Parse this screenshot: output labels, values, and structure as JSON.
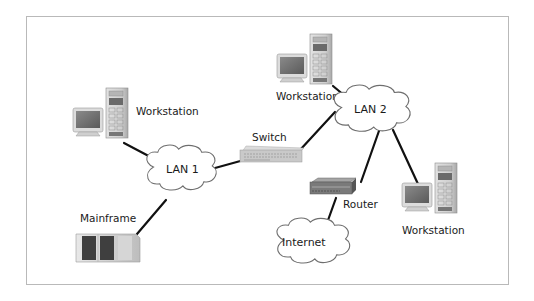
{
  "diagram": {
    "nodes": {
      "workstation_1": {
        "label": "Workstation",
        "type": "workstation"
      },
      "workstation_2": {
        "label": "Workstation",
        "type": "workstation"
      },
      "workstation_3": {
        "label": "Workstation",
        "type": "workstation"
      },
      "mainframe": {
        "label": "Mainframe",
        "type": "mainframe"
      },
      "switch": {
        "label": "Switch",
        "type": "switch"
      },
      "router": {
        "label": "Router",
        "type": "router"
      },
      "lan1": {
        "label": "LAN 1",
        "type": "cloud"
      },
      "lan2": {
        "label": "LAN 2",
        "type": "cloud"
      },
      "internet": {
        "label": "Internet",
        "type": "cloud"
      }
    },
    "edges": [
      [
        "workstation_1",
        "lan1"
      ],
      [
        "mainframe",
        "lan1"
      ],
      [
        "lan1",
        "switch"
      ],
      [
        "switch",
        "lan2"
      ],
      [
        "workstation_2",
        "lan2"
      ],
      [
        "lan2",
        "router"
      ],
      [
        "lan2",
        "workstation_3"
      ],
      [
        "router",
        "internet"
      ]
    ],
    "colors": {
      "frame_border": "#b9b9b9",
      "link": "#111111",
      "cloud_stroke": "#6e6e6e",
      "device_gray": "#c8c8c8"
    }
  }
}
